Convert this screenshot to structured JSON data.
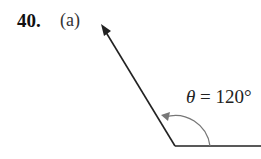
{
  "problem": {
    "number": "40.",
    "part": "(a)"
  },
  "diagram": {
    "angle_symbol": "θ",
    "angle_label_rest": " = 120°",
    "angle_degrees": 120,
    "line_color": "#222222",
    "arc_color": "#777777"
  }
}
